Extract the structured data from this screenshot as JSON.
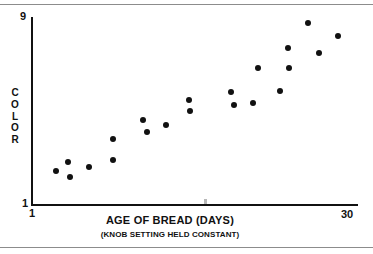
{
  "chart_data": {
    "type": "scatter",
    "title": "",
    "xlabel": "AGE OF BREAD (DAYS)",
    "xsublabel": "(KNOB SETTING HELD CONSTANT)",
    "ylabel": "COLOR",
    "ylabel_letters": [
      "C",
      "O",
      "L",
      "O",
      "R"
    ],
    "xlim": [
      1,
      30
    ],
    "ylim": [
      1,
      9
    ],
    "xticks": [
      "1",
      "30"
    ],
    "yticks": [
      "1",
      "9"
    ],
    "grid": false,
    "legend": null,
    "marker_color": "#111111",
    "axis_color": "#111111",
    "rule_color": "#8c8c8c",
    "points": [
      {
        "x": 3.2,
        "y": 2.45
      },
      {
        "x": 4.3,
        "y": 2.85
      },
      {
        "x": 4.5,
        "y": 2.2
      },
      {
        "x": 6.1,
        "y": 2.6
      },
      {
        "x": 8.3,
        "y": 2.9
      },
      {
        "x": 8.3,
        "y": 3.8
      },
      {
        "x": 10.9,
        "y": 4.6
      },
      {
        "x": 11.3,
        "y": 4.1
      },
      {
        "x": 13.0,
        "y": 4.4
      },
      {
        "x": 15.0,
        "y": 5.45
      },
      {
        "x": 15.1,
        "y": 5.0
      },
      {
        "x": 18.7,
        "y": 5.8
      },
      {
        "x": 19.0,
        "y": 5.25
      },
      {
        "x": 20.7,
        "y": 5.35
      },
      {
        "x": 21.1,
        "y": 6.85
      },
      {
        "x": 23.1,
        "y": 5.85
      },
      {
        "x": 23.8,
        "y": 7.7
      },
      {
        "x": 23.9,
        "y": 6.85
      },
      {
        "x": 25.6,
        "y": 8.75
      },
      {
        "x": 26.5,
        "y": 7.45
      },
      {
        "x": 28.2,
        "y": 8.2
      }
    ]
  }
}
